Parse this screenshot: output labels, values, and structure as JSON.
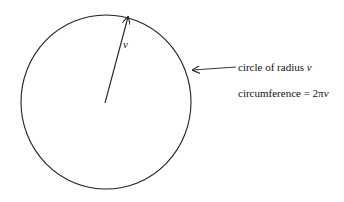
{
  "diagram": {
    "radius_label": "v",
    "annotations": {
      "circle_label_prefix": "circle of radius ",
      "circle_label_var": "v",
      "circumference_prefix": "circumference = 2π",
      "circumference_var": "v"
    },
    "colors": {
      "stroke": "#222222",
      "background": "#ffffff"
    }
  }
}
